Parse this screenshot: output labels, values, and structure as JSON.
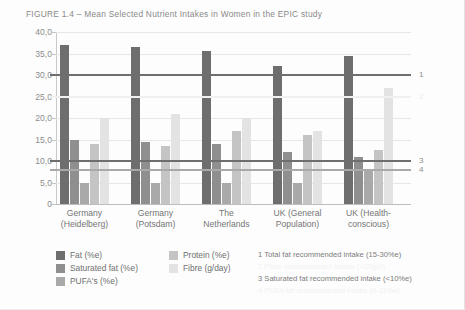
{
  "figure": {
    "title": "FIGURE 1.4 – Mean Selected Nutrient Intakes in Women in the EPIC study"
  },
  "chart_data": {
    "type": "bar",
    "title": "FIGURE 1.4 – Mean Selected Nutrient Intakes in Women in the EPIC study",
    "xlabel": "",
    "ylabel": "",
    "ylim": [
      0,
      40
    ],
    "ytick_labels": [
      "40,0",
      "35,0",
      "30,0",
      "25,0",
      "20,0",
      "15,0",
      "10,0",
      "5,0",
      "0"
    ],
    "ytick_values": [
      40,
      35,
      30,
      25,
      20,
      15,
      10,
      5,
      0
    ],
    "grid": true,
    "legend_position": "bottom-left",
    "categories": [
      "Germany (Heidelberg)",
      "Germany (Potsdam)",
      "The Netherlands",
      "UK (General Population)",
      "UK (Health-conscious)"
    ],
    "category_lines": [
      [
        "Germany",
        "(Heidelberg)"
      ],
      [
        "Germany",
        "(Potsdam)"
      ],
      [
        "The",
        "Netherlands"
      ],
      [
        "UK (General",
        "Population)"
      ],
      [
        "UK (Health-",
        "conscious)"
      ]
    ],
    "series": [
      {
        "name": "Fat (%e)",
        "color": "#6e6e6e",
        "values": [
          37.0,
          36.5,
          35.5,
          32.0,
          34.5
        ]
      },
      {
        "name": "Saturated fat (%e)",
        "color": "#8f8f8f",
        "values": [
          15.0,
          14.5,
          14.0,
          12.0,
          11.0
        ]
      },
      {
        "name": "PUFA's (%e)",
        "color": "#a9a9a9",
        "values": [
          5.0,
          5.0,
          5.0,
          5.0,
          8.0
        ]
      },
      {
        "name": "Protein (%e)",
        "color": "#c4c4c4",
        "values": [
          14.0,
          13.5,
          17.0,
          16.0,
          12.5
        ]
      },
      {
        "name": "Fibre (g/day)",
        "color": "#e3e3e3",
        "values": [
          20.0,
          21.0,
          20.0,
          17.0,
          27.0
        ]
      }
    ],
    "reference_lines": [
      {
        "id": "1",
        "value": 30.0,
        "color": "#6e6e6e",
        "label": "1"
      },
      {
        "id": "2",
        "value": 25.0,
        "color": "#f0f0f0",
        "label": "2"
      },
      {
        "id": "3",
        "value": 10.0,
        "color": "#6e6e6e",
        "label": "3"
      },
      {
        "id": "4",
        "value": 8.0,
        "color": "#a9a9a9",
        "label": "4"
      }
    ],
    "annotations": [
      "1 Total fat recommended intake (15-30%e)",
      "2 Fibre recommended intake (>25g/d)",
      "3 Saturated fat recommended intake (<10%e)",
      "4 PUFA fat recommended intake (6-11%e)"
    ]
  },
  "legend": {
    "items": [
      {
        "label": "Fat (%e)",
        "color": "#6e6e6e"
      },
      {
        "label": "Saturated fat (%e)",
        "color": "#8f8f8f"
      },
      {
        "label": "PUFA's (%e)",
        "color": "#a9a9a9"
      },
      {
        "label": "Protein (%e)",
        "color": "#c4c4c4"
      },
      {
        "label": "Fibre (g/day)",
        "color": "#e3e3e3"
      }
    ]
  },
  "notes": [
    {
      "text": "1 Total fat recommended intake (15-30%e)",
      "faint": false
    },
    {
      "text": "2 Fibre recommended intake (>25g/d)",
      "faint": true
    },
    {
      "text": "3 Saturated fat recommended intake (<10%e)",
      "faint": false
    },
    {
      "text": "4 PUFA fat recommended intake (6-11%e)",
      "faint": true
    }
  ]
}
